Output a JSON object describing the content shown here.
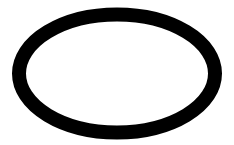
{
  "canvas": {
    "width": 234,
    "height": 145,
    "background_color": "#FFFFFF",
    "alt_text": "Black outlined ellipse on a white background"
  },
  "shape": {
    "name": "ellipse-outline",
    "type": "ellipse",
    "label": "Ellipse",
    "center_x": 117,
    "center_y": 73.5,
    "radius_x": 98,
    "radius_y": 59,
    "stroke_color": "#000000",
    "fill_color": "none",
    "stroke_width": 14,
    "outer_bounds": {
      "left": 12,
      "top": 8,
      "right": 222,
      "bottom": 139,
      "width": 210,
      "height": 131
    },
    "inner_bounds": {
      "left": 28,
      "top": 21,
      "right": 206,
      "bottom": 126,
      "width": 178,
      "height": 105
    }
  }
}
